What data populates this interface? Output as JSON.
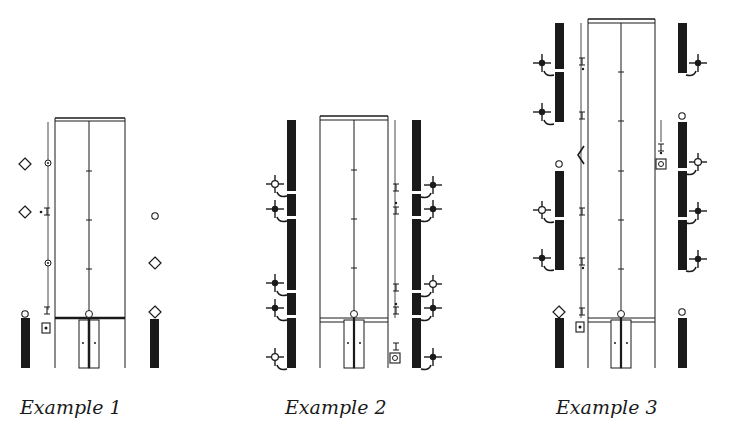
{
  "figure": {
    "captions": [
      "Example 1",
      "Example 2",
      "Example 3"
    ],
    "colors": {
      "ink": "#1a1a1a",
      "paper": "#ffffff",
      "line": "#333333"
    }
  },
  "examples": [
    {
      "label": "Example 1",
      "description": "Narrow room with dashed center line, diamonds and small circles outside walls, short dark bars at bottom"
    },
    {
      "label": "Example 2",
      "description": "Room flanked by segmented dark columns with cross-shaped fixtures on both sides"
    },
    {
      "label": "Example 3",
      "description": "Tall room flanked by segmented dark columns, cross fixtures, circles and diamond markers"
    }
  ]
}
